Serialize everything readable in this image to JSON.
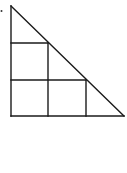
{
  "diagram": {
    "stroke_color": "#1a1a1a",
    "background": "#ffffff",
    "triangle": {
      "apex": [
        11,
        6
      ],
      "right_angle": [
        11,
        116
      ],
      "base_end": [
        124,
        116
      ]
    },
    "grid": {
      "rows": 2,
      "squares": [
        {
          "row": 1,
          "col": 1
        },
        {
          "row": 2,
          "col": 1
        },
        {
          "row": 2,
          "col": 2
        }
      ],
      "vertical_lines_x": [
        48,
        86
      ],
      "horizontal_lines_y": [
        43,
        80
      ]
    },
    "mark": {
      "x": 1.5,
      "y": 11
    }
  }
}
